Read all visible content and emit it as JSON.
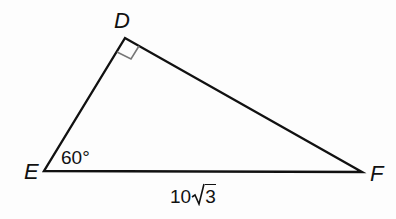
{
  "diagram": {
    "type": "right-triangle",
    "vertices": {
      "D": {
        "label": "D",
        "x": 125,
        "y": 38
      },
      "E": {
        "label": "E",
        "x": 44,
        "y": 171
      },
      "F": {
        "label": "F",
        "x": 362,
        "y": 172
      }
    },
    "angles": {
      "E": "60°",
      "D": "right angle"
    },
    "sides": {
      "EF": {
        "coefficient": "10",
        "radicand": "3",
        "text": "10√3"
      }
    },
    "colors": {
      "stroke": "#111111",
      "right_angle_marker": "#777777"
    }
  }
}
